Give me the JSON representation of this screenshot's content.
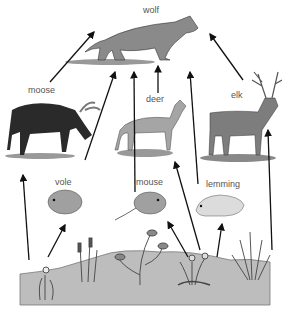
{
  "diagram": {
    "type": "food-web",
    "nodes": [
      {
        "id": "wolf",
        "label": "wolf",
        "role": "top predator"
      },
      {
        "id": "moose",
        "label": "moose",
        "role": "herbivore"
      },
      {
        "id": "deer",
        "label": "deer",
        "role": "herbivore"
      },
      {
        "id": "elk",
        "label": "elk",
        "role": "herbivore"
      },
      {
        "id": "vole",
        "label": "vole",
        "role": "herbivore"
      },
      {
        "id": "mouse",
        "label": "mouse",
        "role": "herbivore"
      },
      {
        "id": "lemming",
        "label": "lemming",
        "role": "herbivore"
      },
      {
        "id": "plants",
        "label": "",
        "role": "producers"
      }
    ],
    "edges": [
      {
        "from": "moose",
        "to": "wolf"
      },
      {
        "from": "vole",
        "to": "wolf"
      },
      {
        "from": "mouse",
        "to": "wolf"
      },
      {
        "from": "deer",
        "to": "wolf"
      },
      {
        "from": "lemming",
        "to": "wolf"
      },
      {
        "from": "elk",
        "to": "wolf"
      },
      {
        "from": "plants",
        "to": "moose"
      },
      {
        "from": "plants",
        "to": "vole"
      },
      {
        "from": "plants",
        "to": "mouse"
      },
      {
        "from": "plants",
        "to": "deer"
      },
      {
        "from": "plants",
        "to": "lemming"
      },
      {
        "from": "plants",
        "to": "elk"
      }
    ]
  },
  "labels": {
    "wolf": "wolf",
    "moose": "moose",
    "deer": "deer",
    "elk": "elk",
    "vole": "vole",
    "mouse": "mouse",
    "lemming": "lemming"
  },
  "colors": {
    "arrow": "#111111",
    "ground": "#b9b9b9",
    "moose": "#2a2a2a",
    "wolf": "#8a8a8a",
    "deer": "#a5a5a5",
    "elk": "#7d7d7d",
    "rodent": "#a0a0a0",
    "lemming": "#dcdcdc"
  }
}
